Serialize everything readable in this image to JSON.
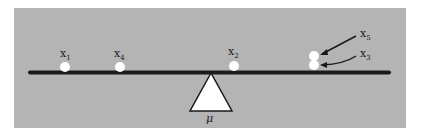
{
  "diagram": {
    "colors": {
      "background": "#b4b4b4",
      "beam": "#1a1a1a",
      "points": "#ffffff",
      "fulcrum": "#ffffff"
    },
    "fulcrum_label": "μ",
    "points": [
      {
        "name": "x",
        "sub": "1",
        "cx": 65,
        "cy": 67
      },
      {
        "name": "x",
        "sub": "4",
        "cx": 120,
        "cy": 67
      },
      {
        "name": "x",
        "sub": "2",
        "cx": 234,
        "cy": 66
      },
      {
        "name": "x",
        "sub": "5",
        "cx": 314,
        "cy": 56
      },
      {
        "name": "x",
        "sub": "3",
        "cx": 314,
        "cy": 65
      }
    ],
    "labels": {
      "x1": {
        "main": "x",
        "sub": "1"
      },
      "x4": {
        "main": "x",
        "sub": "4"
      },
      "x2": {
        "main": "x",
        "sub": "2"
      },
      "x5": {
        "main": "x",
        "sub": "5"
      },
      "x3": {
        "main": "x",
        "sub": "3"
      }
    }
  }
}
